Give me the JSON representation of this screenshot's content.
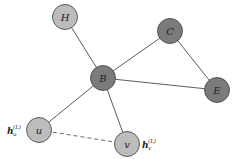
{
  "diagram": {
    "type": "graph",
    "colors": {
      "dark_node": "#7b7b7b",
      "light_node": "#bcbcbc",
      "edge": "#4a4a4a"
    },
    "nodes": [
      {
        "id": "H",
        "label": "H",
        "shade": "light"
      },
      {
        "id": "C",
        "label": "C",
        "shade": "dark"
      },
      {
        "id": "B",
        "label": "B",
        "shade": "dark"
      },
      {
        "id": "E",
        "label": "E",
        "shade": "dark"
      },
      {
        "id": "u",
        "label": "u",
        "shade": "light"
      },
      {
        "id": "v",
        "label": "v",
        "shade": "light"
      }
    ],
    "edges": [
      {
        "from": "H",
        "to": "B",
        "style": "solid"
      },
      {
        "from": "B",
        "to": "C",
        "style": "solid"
      },
      {
        "from": "C",
        "to": "E",
        "style": "solid"
      },
      {
        "from": "B",
        "to": "E",
        "style": "solid"
      },
      {
        "from": "B",
        "to": "u",
        "style": "solid"
      },
      {
        "from": "B",
        "to": "v",
        "style": "solid"
      },
      {
        "from": "u",
        "to": "v",
        "style": "dashed"
      }
    ],
    "embeddings": [
      {
        "node": "u",
        "symbol": "h",
        "subscript": "u",
        "superscript": "(L)"
      },
      {
        "node": "v",
        "symbol": "h",
        "subscript": "v",
        "superscript": "(L)"
      }
    ]
  }
}
